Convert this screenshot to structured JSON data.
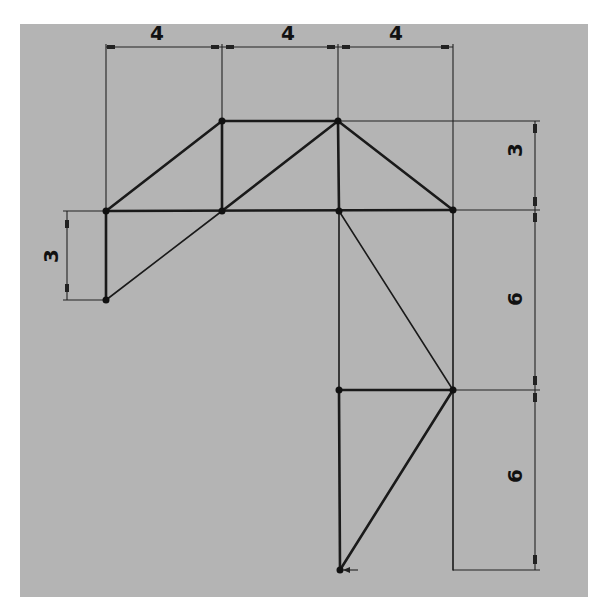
{
  "diagram": {
    "type": "truss-sketch",
    "background_color": "#b4b4b4",
    "line_color": "#1a1a1a",
    "dimensions": {
      "top": [
        "4",
        "4",
        "4"
      ],
      "right": [
        "3",
        "6",
        "6"
      ],
      "left": [
        "3"
      ]
    },
    "nodes": [
      {
        "id": "A",
        "x": 106,
        "y": 211
      },
      {
        "id": "B",
        "x": 222,
        "y": 121
      },
      {
        "id": "C",
        "x": 338,
        "y": 121
      },
      {
        "id": "D",
        "x": 222,
        "y": 211
      },
      {
        "id": "E",
        "x": 339,
        "y": 211
      },
      {
        "id": "F",
        "x": 453,
        "y": 210
      },
      {
        "id": "G",
        "x": 106,
        "y": 300
      },
      {
        "id": "H",
        "x": 339,
        "y": 390
      },
      {
        "id": "I",
        "x": 453,
        "y": 390
      },
      {
        "id": "J",
        "x": 340,
        "y": 570
      }
    ],
    "members": [
      [
        "A",
        "B"
      ],
      [
        "B",
        "C"
      ],
      [
        "B",
        "D"
      ],
      [
        "C",
        "D"
      ],
      [
        "C",
        "E"
      ],
      [
        "C",
        "F"
      ],
      [
        "A",
        "D"
      ],
      [
        "D",
        "E"
      ],
      [
        "E",
        "F"
      ],
      [
        "A",
        "G"
      ],
      [
        "G",
        "D"
      ],
      [
        "E",
        "H"
      ],
      [
        "E",
        "I"
      ],
      [
        "F",
        "I"
      ],
      [
        "H",
        "I"
      ],
      [
        "H",
        "J"
      ],
      [
        "I",
        "J"
      ]
    ]
  }
}
